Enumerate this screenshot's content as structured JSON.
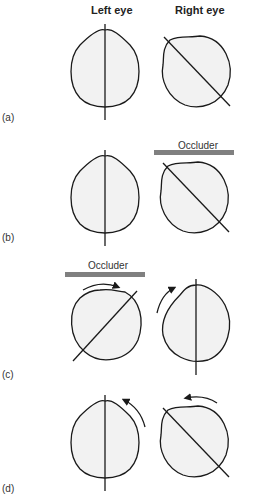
{
  "headers": {
    "left": "Left eye",
    "right": "Right eye"
  },
  "panels": [
    {
      "label": "(a)",
      "occluder": null
    },
    {
      "label": "(b)",
      "occluder": "Occluder"
    },
    {
      "label": "(c)",
      "occluder": "Occluder"
    },
    {
      "label": "(d)",
      "occluder": null
    }
  ],
  "colors": {
    "stroke": "#1a1a1a",
    "fill": "#f2f2f2",
    "occluder_bar": "#808080"
  }
}
